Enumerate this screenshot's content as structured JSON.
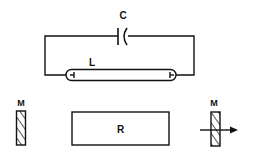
{
  "diagram": {
    "components": {
      "capacitor": {
        "label": "C"
      },
      "tube": {
        "label": "L"
      },
      "mirror_left": {
        "label": "M"
      },
      "rod": {
        "label": "R"
      },
      "mirror_right": {
        "label": "M"
      }
    },
    "output_arrow": "arrow-right",
    "stroke_color": "#111111",
    "background": "#ffffff"
  }
}
